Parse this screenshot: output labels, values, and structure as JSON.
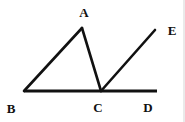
{
  "figure": {
    "background_color": "#ffffff",
    "stroke_color": "#111111",
    "stroke_width": 2.6,
    "width": 185,
    "height": 122,
    "points": {
      "A": {
        "x": 82,
        "y": 28
      },
      "B": {
        "x": 24,
        "y": 91
      },
      "C": {
        "x": 101,
        "y": 91
      },
      "D": {
        "x": 157,
        "y": 91
      },
      "E": {
        "x": 155,
        "y": 30
      }
    },
    "segments": [
      {
        "name": "segment-BD-baseline",
        "from": "B",
        "to": "D"
      },
      {
        "name": "segment-BA",
        "from": "B",
        "to": "A"
      },
      {
        "name": "segment-AC",
        "from": "A",
        "to": "C"
      },
      {
        "name": "segment-CE-ray",
        "from": "C",
        "to": "E"
      }
    ],
    "labels": [
      {
        "id": "A",
        "text": "A",
        "x": 84,
        "y": 12
      },
      {
        "id": "B",
        "text": "B",
        "x": 11,
        "y": 108
      },
      {
        "id": "C",
        "text": "C",
        "x": 98,
        "y": 107
      },
      {
        "id": "D",
        "text": "D",
        "x": 148,
        "y": 107
      },
      {
        "id": "E",
        "text": "E",
        "x": 172,
        "y": 30
      }
    ]
  }
}
